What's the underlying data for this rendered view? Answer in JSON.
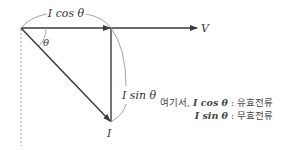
{
  "diagram": {
    "type": "phasor-diagram",
    "colors": {
      "line": "#3a3a3a",
      "arc": "#9a9a9a",
      "dashed": "#9a9a9a",
      "text": "#333333"
    },
    "labels": {
      "voltage": "V",
      "current": "I",
      "angle": "θ",
      "cos_component": "I cos θ",
      "sin_component": "I sin θ"
    },
    "legend": {
      "prefix": "여기서,",
      "rows": [
        {
          "term": "I cos θ",
          "separator": ":",
          "meaning": "유효전류"
        },
        {
          "term": "I sin θ",
          "separator": ":",
          "meaning": "무효전류"
        }
      ]
    }
  }
}
